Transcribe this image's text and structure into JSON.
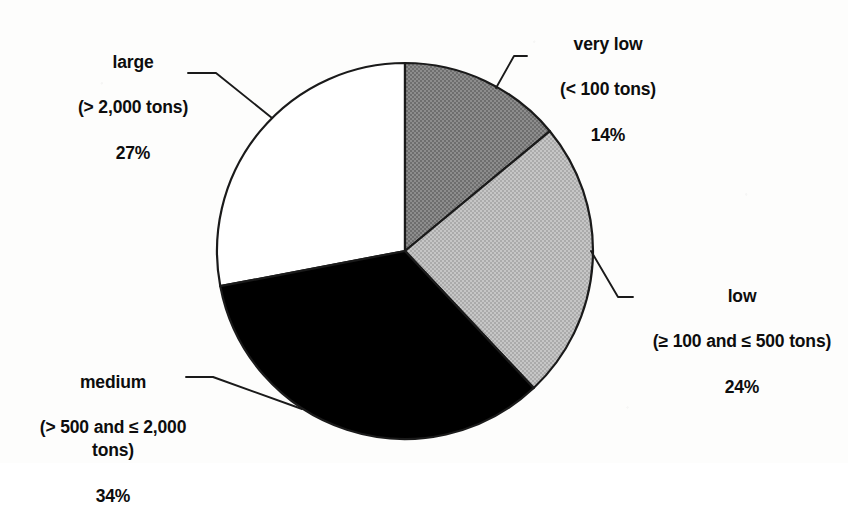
{
  "chart_data": {
    "type": "pie",
    "title": "",
    "subtitle": "",
    "xlabel": "",
    "ylabel": "",
    "legend_position": "outside-callouts",
    "grid": false,
    "units": "percent",
    "total": 99,
    "center": {
      "x": 405,
      "y": 251
    },
    "radius": 188,
    "start_angle_deg": 0,
    "direction": "clockwise",
    "categories": [
      "very low",
      "low",
      "medium",
      "large"
    ],
    "values": [
      14,
      24,
      34,
      27
    ],
    "slices": [
      {
        "name": "very low",
        "range": "(< 100 tons)",
        "pct": "14%",
        "value": 14,
        "color": "#808080",
        "start_deg": 0,
        "end_deg": 50.4
      },
      {
        "name": "low",
        "range": "(≥ 100 and ≤ 500 tons)",
        "pct": "24%",
        "value": 24,
        "color": "#bdbdbd",
        "start_deg": 50.4,
        "end_deg": 136.8
      },
      {
        "name": "medium",
        "range": "(> 500 and ≤ 2,000\ntons)",
        "pct": "34%",
        "value": 34,
        "color": "#000000",
        "start_deg": 136.8,
        "end_deg": 259.2
      },
      {
        "name": "large",
        "range": "(> 2,000 tons)",
        "pct": "27%",
        "value": 27,
        "color": "#ffffff",
        "start_deg": 259.2,
        "end_deg": 360
      }
    ]
  },
  "labels": {
    "large": {
      "name": "large",
      "range": "(> 2,000 tons)",
      "pct": "27%"
    },
    "very_low": {
      "name": "very low",
      "range": "(< 100 tons)",
      "pct": "14%"
    },
    "low": {
      "name": "low",
      "range": "(≥ 100 and ≤ 500 tons)",
      "pct": "24%"
    },
    "medium": {
      "name": "medium",
      "range": "(> 500 and ≤ 2,000\ntons)",
      "pct": "34%"
    }
  },
  "colors": {
    "very_low": "#808080",
    "low": "#bdbdbd",
    "medium": "#000000",
    "large": "#ffffff",
    "outline": "#1a1a1a",
    "background": "#fdfdfc",
    "text": "#0d0d0d"
  }
}
